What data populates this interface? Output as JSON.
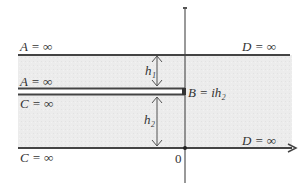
{
  "figure": {
    "labels": {
      "top_left": "A = ∞",
      "top_right": "D = ∞",
      "slit_upper_left": "A = ∞",
      "slit_lower_left": "C = ∞",
      "bottom_left": "C = ∞",
      "bottom_right": "D = ∞",
      "slit_tip": "B = ih₂",
      "h1": "h₁",
      "h2": "h₂",
      "origin": "0"
    },
    "colors": {
      "fill": "#ececec",
      "line": "#444444",
      "axis": "#555555"
    }
  }
}
